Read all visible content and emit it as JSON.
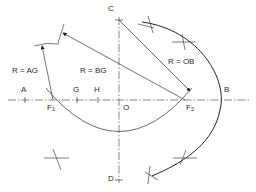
{
  "diagram": {
    "title": "",
    "colors": {
      "line": "#2a2a2a",
      "construction": "#6a6a6a",
      "background": "#ffffff"
    },
    "points": {
      "A": {
        "label": "A"
      },
      "G": {
        "label": "G"
      },
      "H": {
        "label": "H"
      },
      "O": {
        "label": "O"
      },
      "B": {
        "label": "B"
      },
      "C": {
        "label": "C"
      },
      "D": {
        "label": "D"
      },
      "F1": {
        "label": "F",
        "sub": "1"
      },
      "F2": {
        "label": "F",
        "sub": "2"
      }
    },
    "annotations": {
      "r_ag": "R = AG",
      "r_bg": "R = BG",
      "r_ob": "R = OB"
    }
  }
}
